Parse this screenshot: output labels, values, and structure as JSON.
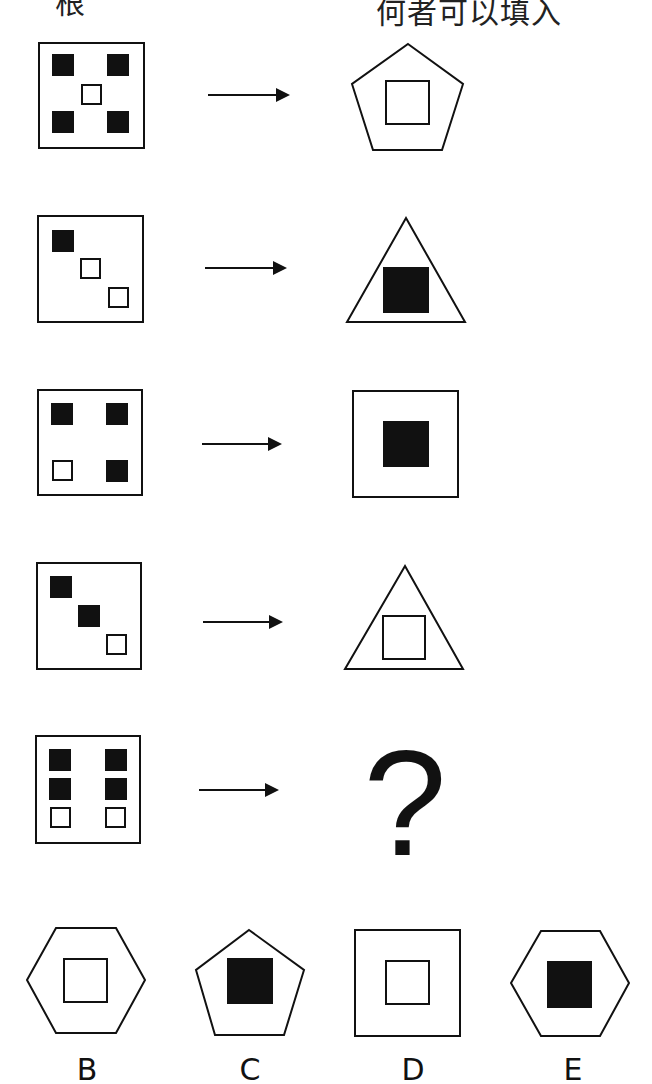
{
  "header": {
    "left_text": "根",
    "right_text": "何者可以填入"
  },
  "colors": {
    "stroke": "#111111",
    "fill_black": "#111111",
    "background": "#ffffff"
  },
  "rows": [
    {
      "index": 1,
      "input": {
        "frame": "square",
        "cells": [
          {
            "pos": "top-left",
            "fill": "black"
          },
          {
            "pos": "top-right",
            "fill": "black"
          },
          {
            "pos": "center",
            "fill": "white"
          },
          {
            "pos": "bottom-left",
            "fill": "black"
          },
          {
            "pos": "bottom-right",
            "fill": "black"
          }
        ]
      },
      "arrow": "right-arrow",
      "output": {
        "outer_shape": "pentagon",
        "inner_square": "white"
      }
    },
    {
      "index": 2,
      "input": {
        "frame": "square",
        "cells": [
          {
            "pos": "top-left",
            "fill": "black"
          },
          {
            "pos": "center",
            "fill": "white"
          },
          {
            "pos": "bottom-right",
            "fill": "white"
          }
        ]
      },
      "arrow": "right-arrow",
      "output": {
        "outer_shape": "triangle",
        "inner_square": "black"
      }
    },
    {
      "index": 3,
      "input": {
        "frame": "square",
        "cells": [
          {
            "pos": "top-left",
            "fill": "black"
          },
          {
            "pos": "top-right",
            "fill": "black"
          },
          {
            "pos": "bottom-left",
            "fill": "white"
          },
          {
            "pos": "bottom-right",
            "fill": "black"
          }
        ]
      },
      "arrow": "right-arrow",
      "output": {
        "outer_shape": "square",
        "inner_square": "black"
      }
    },
    {
      "index": 4,
      "input": {
        "frame": "square",
        "cells": [
          {
            "pos": "top-left",
            "fill": "black"
          },
          {
            "pos": "center",
            "fill": "black"
          },
          {
            "pos": "bottom-right",
            "fill": "white"
          }
        ]
      },
      "arrow": "right-arrow",
      "output": {
        "outer_shape": "triangle",
        "inner_square": "white"
      }
    },
    {
      "index": 5,
      "input": {
        "frame": "square",
        "cells": [
          {
            "pos": "top-left",
            "fill": "black"
          },
          {
            "pos": "top-right",
            "fill": "black"
          },
          {
            "pos": "mid-left",
            "fill": "black"
          },
          {
            "pos": "mid-right",
            "fill": "black"
          },
          {
            "pos": "bottom-left",
            "fill": "white"
          },
          {
            "pos": "bottom-right",
            "fill": "white"
          }
        ]
      },
      "arrow": "right-arrow",
      "output": {
        "unknown": true,
        "symbol": "?"
      }
    }
  ],
  "options": [
    {
      "label": "B",
      "outer_shape": "hexagon",
      "inner_square": "white"
    },
    {
      "label": "C",
      "outer_shape": "pentagon",
      "inner_square": "black"
    },
    {
      "label": "D",
      "outer_shape": "square",
      "inner_square": "white"
    },
    {
      "label": "E",
      "outer_shape": "hexagon",
      "inner_square": "black"
    }
  ]
}
